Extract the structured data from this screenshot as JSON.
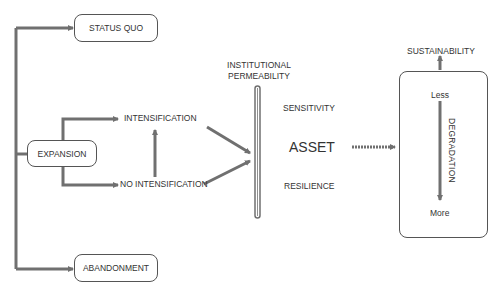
{
  "diagram": {
    "nodes": {
      "status_quo": "STATUS QUO",
      "expansion": "EXPANSION",
      "abandonment": "ABANDONMENT",
      "intensification": "INTENSIFICATION",
      "no_intensification": "NO INTENSIFICATION",
      "institutional_permeability_line1": "INSTITUTIONAL",
      "institutional_permeability_line2": "PERMEABILITY",
      "sensitivity": "SENSITIVITY",
      "asset": "ASSET",
      "resilience": "RESILIENCE",
      "sustainability": "SUSTAINABILITY",
      "less": "Less",
      "degradation": "DEGRADATION",
      "more": "More"
    },
    "colors": {
      "line": "#707070",
      "box_border": "#555555",
      "text": "#333333"
    }
  }
}
